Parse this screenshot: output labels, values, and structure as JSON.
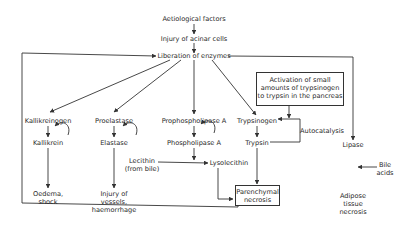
{
  "diagram": {
    "nodes": {
      "aetiological_factors": "Aetiological factors",
      "injury_acinar": "Injury of acinar cells",
      "liberation": "Liberation of enzymes",
      "kallikreinogen": "Kallikreinogen",
      "kallikrein": "Kallikrein",
      "oedema_1": "Oedema,",
      "oedema_2": "shock",
      "proelastase": "Proelastase",
      "elastase": "Elastase",
      "injury_vessels_1": "Injury of",
      "injury_vessels_2": "vessels,",
      "injury_vessels_3": "haemorrhage",
      "prophospholipase": "Prophospholipase A",
      "phospholipase": "Phospholipase A",
      "lecithin_1": "Lecithin",
      "lecithin_2": "(from bile)",
      "lysolecithin": "Lysolecithin",
      "activation_1": "Activation of small",
      "activation_2": "amounts of trypsinogen",
      "activation_3": "to trypsin in the pancreas",
      "trypsinogen": "Trypsinogen",
      "autocatalysis": "Autocatalysis",
      "trypsin": "Trypsin",
      "parenchymal_1": "Parenchymal",
      "parenchymal_2": "necrosis",
      "lipase": "Lipase",
      "bile_acids_1": "Bile",
      "bile_acids_2": "acids",
      "adipose_1": "Adipose",
      "adipose_2": "tissue",
      "adipose_3": "necrosis"
    },
    "colors": {
      "line": "#333333",
      "text": "#2a2a2a",
      "background": "#ffffff"
    }
  }
}
